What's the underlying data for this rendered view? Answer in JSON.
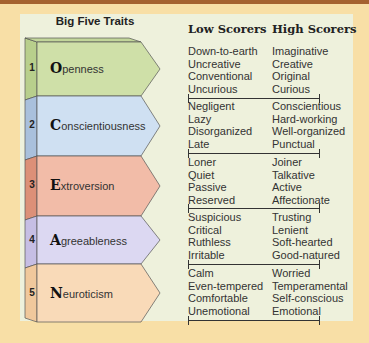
{
  "title": "Big Five Traits",
  "columns": {
    "low": "Low Scorers",
    "high": "High Scorers"
  },
  "colors": {
    "background": "#f8dfa6",
    "panel": "#eef1dc",
    "top_bar": "#a5622f",
    "openness": "#cfe0a8",
    "conscientiousness": "#cfe0f2",
    "extroversion": "#f2bca8",
    "agreeableness": "#dcd8f2",
    "neuroticism": "#f9dab8"
  },
  "traits": [
    {
      "number": "1",
      "initial": "O",
      "rest": "penness",
      "low": [
        "Down-to-earth",
        "Uncreative",
        "Conventional",
        "Uncurious"
      ],
      "high": [
        "Imaginative",
        "Creative",
        "Original",
        "Curious"
      ]
    },
    {
      "number": "2",
      "initial": "C",
      "rest": "onscientiousness",
      "low": [
        "Negligent",
        "Lazy",
        "Disorganized",
        "Late"
      ],
      "high": [
        "Conscientious",
        "Hard-working",
        "Well-organized",
        "Punctual"
      ]
    },
    {
      "number": "3",
      "initial": "E",
      "rest": "xtroversion",
      "low": [
        "Loner",
        "Quiet",
        "Passive",
        "Reserved"
      ],
      "high": [
        "Joiner",
        "Talkative",
        "Active",
        "Affectionate"
      ]
    },
    {
      "number": "4",
      "initial": "A",
      "rest": "greeableness",
      "low": [
        "Suspicious",
        "Critical",
        "Ruthless",
        "Irritable"
      ],
      "high": [
        "Trusting",
        "Lenient",
        "Soft-hearted",
        "Good-natured"
      ]
    },
    {
      "number": "5",
      "initial": "N",
      "rest": "euroticism",
      "low": [
        "Calm",
        "Even-tempered",
        "Comfortable",
        "Unemotional"
      ],
      "high": [
        "Worried",
        "Temperamental",
        "Self-conscious",
        "Emotional"
      ]
    }
  ]
}
